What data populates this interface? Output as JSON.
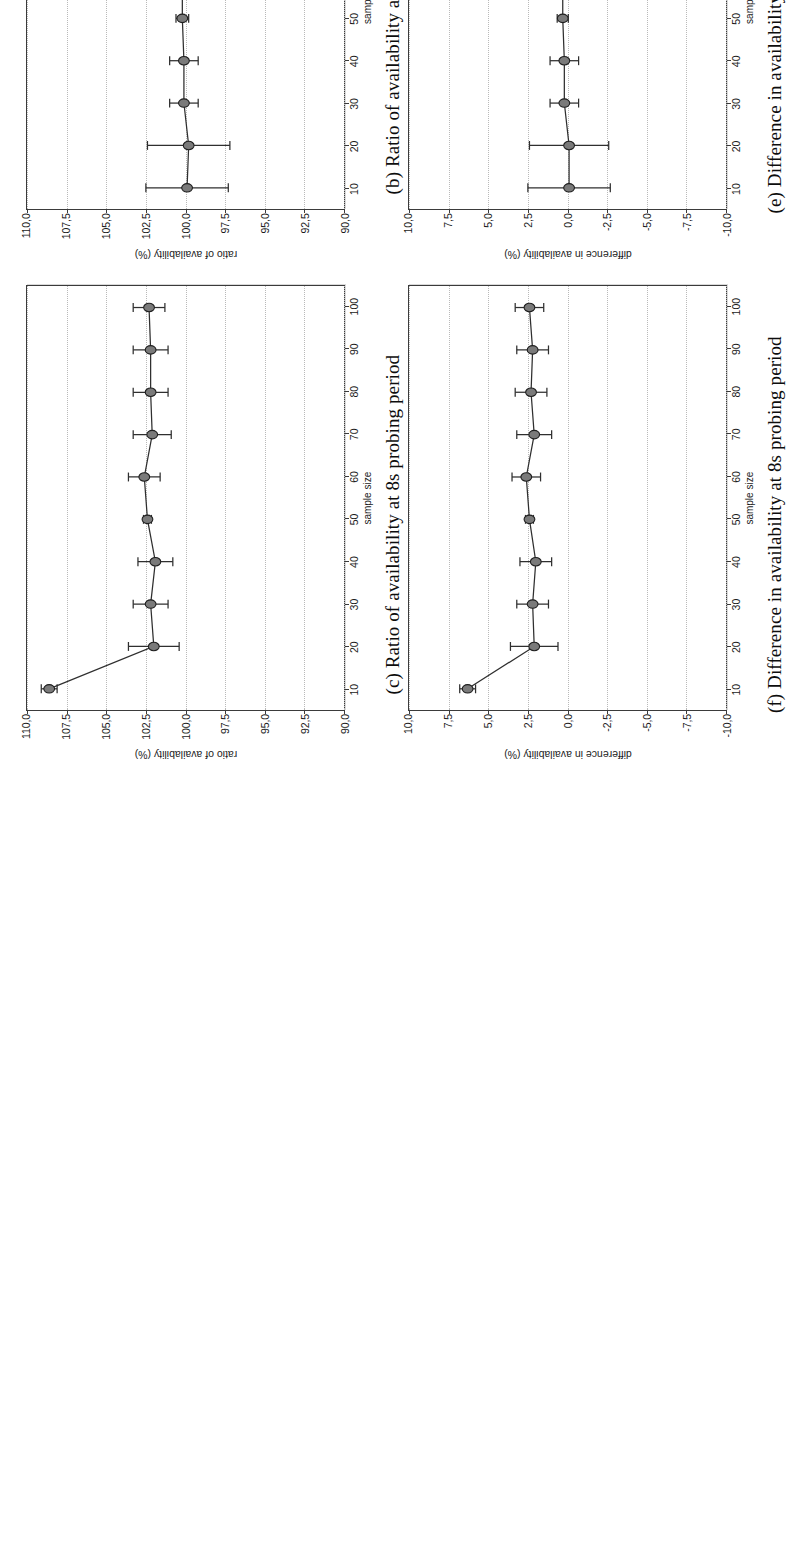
{
  "figure": {
    "xlabel": "sample size",
    "ratio_ylabel": "ratio of availability (%)",
    "diff_ylabel": "difference in availability (%)",
    "xticks": [
      10,
      20,
      30,
      40,
      50,
      60,
      70,
      80,
      90,
      100
    ],
    "ratio_yticks": [
      "110,0",
      "107,5",
      "105,0",
      "102,5",
      "100,0",
      "97,5",
      "95,0",
      "92,5",
      "90,0"
    ],
    "diff_yticks": [
      "10,0",
      "7,5",
      "5,0",
      "2,5",
      "0,0",
      "-2,5",
      "-5,0",
      "-7,5",
      "-10,0"
    ],
    "line_color": "#2f2f2f",
    "marker_fill": "#7a7a7a",
    "grid_color": "#b9b9b9"
  },
  "panels": [
    {
      "key": "c",
      "caption": "(c) Ratio of availability at 8s probing period",
      "chart_data": {
        "type": "line",
        "title": "Ratio of availability at 8s probing period",
        "xlabel": "sample size",
        "ylabel": "ratio of availability (%)",
        "xlim": [
          5,
          105
        ],
        "ylim": [
          90.0,
          110.0
        ],
        "grid": true,
        "x": [
          10,
          20,
          30,
          40,
          50,
          60,
          70,
          80,
          90,
          100
        ],
        "values": [
          108.6,
          102.0,
          102.2,
          101.9,
          102.4,
          102.6,
          102.1,
          102.2,
          102.2,
          102.3
        ],
        "yerr": [
          0.5,
          1.6,
          1.1,
          1.1,
          0.25,
          1.0,
          1.2,
          1.1,
          1.1,
          1.0
        ]
      }
    },
    {
      "key": "b",
      "caption": "(b) Ratio of availability at 6s probing period",
      "chart_data": {
        "type": "line",
        "title": "Ratio of availability at 6s probing period",
        "xlabel": "sample size",
        "ylabel": "ratio of availability (%)",
        "xlim": [
          5,
          105
        ],
        "ylim": [
          90.0,
          110.0
        ],
        "grid": true,
        "x": [
          10,
          20,
          30,
          40,
          50,
          60,
          70,
          80,
          90,
          100
        ],
        "values": [
          99.9,
          99.8,
          100.1,
          100.1,
          100.2,
          100.2,
          100.3,
          100.3,
          100.2,
          100.3
        ],
        "yerr": [
          2.6,
          2.6,
          0.9,
          0.9,
          0.4,
          0.5,
          0.4,
          0.35,
          0.3,
          0.7
        ]
      }
    },
    {
      "key": "a",
      "caption": "(a) Ratio of availability at 4s probing period",
      "chart_data": {
        "type": "line",
        "title": "Ratio of availability at 4s probing period",
        "xlabel": "sample size",
        "ylabel": "ratio of availability (%)",
        "xlim": [
          5,
          105
        ],
        "ylim": [
          90.0,
          110.0
        ],
        "grid": true,
        "x": [
          10,
          20,
          30,
          40,
          50,
          60,
          70,
          80,
          90,
          100
        ],
        "values": [
          97.6,
          97.8,
          99.2,
          99.4,
          99.7,
          99.9,
          100.0,
          100.4,
          100.2,
          100.0
        ],
        "yerr": [
          2.7,
          2.2,
          1.2,
          1.1,
          1.1,
          1.1,
          1.6,
          0.8,
          0.9,
          0.8
        ]
      }
    },
    {
      "key": "f",
      "caption": "(f) Difference in availability at 8s probing period",
      "chart_data": {
        "type": "line",
        "title": "Difference in availability at 8s probing period",
        "xlabel": "sample size",
        "ylabel": "difference in availability (%)",
        "xlim": [
          5,
          105
        ],
        "ylim": [
          -10.0,
          10.0
        ],
        "grid": true,
        "x": [
          10,
          20,
          30,
          40,
          50,
          60,
          70,
          80,
          90,
          100
        ],
        "values": [
          6.3,
          2.1,
          2.2,
          2.0,
          2.4,
          2.6,
          2.1,
          2.3,
          2.2,
          2.4
        ],
        "yerr": [
          0.5,
          1.5,
          1.0,
          1.0,
          0.25,
          0.9,
          1.1,
          1.0,
          1.0,
          0.9
        ]
      }
    },
    {
      "key": "e",
      "caption": "(e) Difference in availability at 6s probing period",
      "chart_data": {
        "type": "line",
        "title": "Difference in availability at 6s probing period",
        "xlabel": "sample size",
        "ylabel": "difference in availability (%)",
        "xlim": [
          5,
          105
        ],
        "ylim": [
          -10.0,
          10.0
        ],
        "grid": true,
        "x": [
          10,
          20,
          30,
          40,
          50,
          60,
          70,
          80,
          90,
          100
        ],
        "values": [
          -0.1,
          -0.1,
          0.2,
          0.2,
          0.3,
          0.3,
          0.3,
          0.3,
          0.2,
          0.3
        ],
        "yerr": [
          2.6,
          2.5,
          0.9,
          0.9,
          0.35,
          0.5,
          0.35,
          0.3,
          0.25,
          0.65
        ]
      }
    },
    {
      "key": "d",
      "caption": "(d) Difference in availability at 4s probing period",
      "chart_data": {
        "type": "line",
        "title": "Difference in availability at 4s probing period",
        "xlabel": "sample size",
        "ylabel": "difference in availability (%)",
        "xlim": [
          5,
          105
        ],
        "ylim": [
          -10.0,
          10.0
        ],
        "grid": true,
        "x": [
          10,
          20,
          30,
          40,
          50,
          60,
          70,
          80,
          90,
          100
        ],
        "values": [
          -2.3,
          -2.1,
          -0.7,
          -0.6,
          -0.3,
          -0.2,
          -0.1,
          0.3,
          0.1,
          0.0
        ],
        "yerr": [
          2.7,
          2.2,
          1.2,
          1.1,
          1.1,
          1.1,
          1.6,
          0.8,
          0.9,
          0.8
        ]
      }
    }
  ]
}
